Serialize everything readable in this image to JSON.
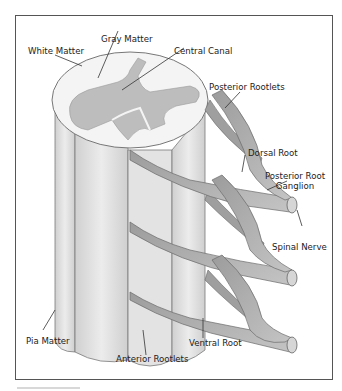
{
  "diagram": {
    "labels": {
      "white_matter": "White Matter",
      "gray_matter": "Gray Matter",
      "central_canal": "Central Canal",
      "posterior_rootlets": "Posterior Rootlets",
      "dorsal_root": "Dorsal Root",
      "posterior_root_ganglion_line1": "Posterior Root",
      "posterior_root_ganglion_line2": "Ganglion",
      "spinal_nerve": "Spinal Nerve",
      "pia_matter": "Pia Matter",
      "anterior_rootlets": "Anterior Rootlets",
      "ventral_root": "Ventral Root"
    },
    "colors": {
      "frame": "#555555",
      "outline": "#6e6e6e",
      "white_matter_fill": "#f2f2f2",
      "gray_matter_fill": "#bdbdbd",
      "column_fill": "#dcdcdc",
      "nerve_fill": "#a9a9a9",
      "leader_line": "#333333"
    }
  }
}
